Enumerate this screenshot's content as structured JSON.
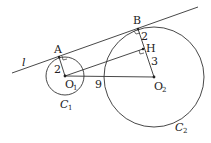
{
  "labels": {
    "line": "l",
    "A": "A",
    "B": "B",
    "H": "H",
    "O1": "O",
    "O1_sub": "1",
    "O2": "O",
    "O2_sub": "2",
    "C1": "C",
    "C1_sub": "1",
    "C2": "C",
    "C2_sub": "2",
    "r1": "2",
    "bh": "2",
    "ho2": "3",
    "dist": "9"
  },
  "colors": {
    "stroke": "#333333",
    "text": "#222222"
  }
}
